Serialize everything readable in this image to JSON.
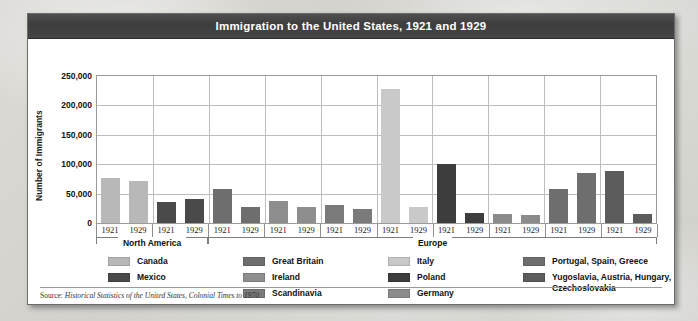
{
  "window": {
    "title": "Immigration to the United States, 1921 and 1929"
  },
  "source": {
    "lead": "Source: ",
    "citation": "Historical Statistics of the United States, Colonial Times to 1970"
  },
  "regions": [
    {
      "label": "North America",
      "span": 4
    },
    {
      "label": "Europe",
      "span": 16
    }
  ],
  "legend": {
    "columns": [
      {
        "items": [
          {
            "label": "Canada",
            "color": "#b8b8b8"
          },
          {
            "label": "Mexico",
            "color": "#4a4a4a"
          }
        ]
      },
      {
        "items": [
          {
            "label": "Great Britain",
            "color": "#6e6e6e"
          },
          {
            "label": "Ireland",
            "color": "#8e8e8e"
          },
          {
            "label": "Scandinavia",
            "color": "#7a7a7a"
          }
        ]
      },
      {
        "items": [
          {
            "label": "Italy",
            "color": "#c9c9c9"
          },
          {
            "label": "Poland",
            "color": "#3d3d3d"
          },
          {
            "label": "Germany",
            "color": "#8b8b8b"
          }
        ]
      },
      {
        "items": [
          {
            "label": "Portugal, Spain, Greece",
            "color": "#6e6e6e"
          },
          {
            "label": "Yugoslavia, Austria, Hungary, Czechoslovakia",
            "color": "#5c5c5c"
          }
        ]
      }
    ]
  },
  "chart_data": {
    "type": "bar",
    "title": "Immigration to the United States, 1921 and 1929",
    "xlabel": "",
    "ylabel": "Number of Immigrants",
    "ylim": [
      0,
      250000
    ],
    "yticks": [
      0,
      50000,
      100000,
      150000,
      200000,
      250000
    ],
    "ytick_labels": [
      "0",
      "50,000",
      "100,000",
      "150,000",
      "200,000",
      "250,000"
    ],
    "grid": true,
    "legend_position": "bottom",
    "years": [
      "1921",
      "1929"
    ],
    "categories": [
      "Canada",
      "Mexico",
      "Great Britain",
      "Ireland",
      "Scandinavia",
      "Italy",
      "Poland",
      "Germany",
      "Portugal, Spain, Greece",
      "Yugoslavia, Austria, Hungary, Czechoslovakia"
    ],
    "series": [
      {
        "name": "1921",
        "values": [
          76000,
          35000,
          57000,
          37000,
          30000,
          228000,
          101000,
          15000,
          58000,
          88000
        ]
      },
      {
        "name": "1929",
        "values": [
          71000,
          40000,
          27000,
          28000,
          24000,
          28000,
          17000,
          14000,
          85000,
          15000
        ]
      }
    ],
    "bars": [
      {
        "category": "Canada",
        "year": "1921",
        "value": 76000,
        "color": "#b8b8b8"
      },
      {
        "category": "Canada",
        "year": "1929",
        "value": 71000,
        "color": "#b8b8b8"
      },
      {
        "category": "Mexico",
        "year": "1921",
        "value": 35000,
        "color": "#4a4a4a"
      },
      {
        "category": "Mexico",
        "year": "1929",
        "value": 40000,
        "color": "#4a4a4a"
      },
      {
        "category": "Great Britain",
        "year": "1921",
        "value": 57000,
        "color": "#6e6e6e"
      },
      {
        "category": "Great Britain",
        "year": "1929",
        "value": 27000,
        "color": "#6e6e6e"
      },
      {
        "category": "Ireland",
        "year": "1921",
        "value": 37000,
        "color": "#8e8e8e"
      },
      {
        "category": "Ireland",
        "year": "1929",
        "value": 28000,
        "color": "#8e8e8e"
      },
      {
        "category": "Scandinavia",
        "year": "1921",
        "value": 30000,
        "color": "#7a7a7a"
      },
      {
        "category": "Scandinavia",
        "year": "1929",
        "value": 24000,
        "color": "#7a7a7a"
      },
      {
        "category": "Italy",
        "year": "1921",
        "value": 228000,
        "color": "#c9c9c9"
      },
      {
        "category": "Italy",
        "year": "1929",
        "value": 28000,
        "color": "#c9c9c9"
      },
      {
        "category": "Poland",
        "year": "1921",
        "value": 101000,
        "color": "#3d3d3d"
      },
      {
        "category": "Poland",
        "year": "1929",
        "value": 17000,
        "color": "#3d3d3d"
      },
      {
        "category": "Germany",
        "year": "1921",
        "value": 15000,
        "color": "#8b8b8b"
      },
      {
        "category": "Germany",
        "year": "1929",
        "value": 14000,
        "color": "#8b8b8b"
      },
      {
        "category": "Portugal, Spain, Greece",
        "year": "1921",
        "value": 58000,
        "color": "#6e6e6e"
      },
      {
        "category": "Portugal, Spain, Greece",
        "year": "1929",
        "value": 85000,
        "color": "#6e6e6e"
      },
      {
        "category": "Yugoslavia, Austria, Hungary, Czechoslovakia",
        "year": "1921",
        "value": 88000,
        "color": "#5c5c5c"
      },
      {
        "category": "Yugoslavia, Austria, Hungary, Czechoslovakia",
        "year": "1929",
        "value": 15000,
        "color": "#5c5c5c"
      }
    ]
  }
}
